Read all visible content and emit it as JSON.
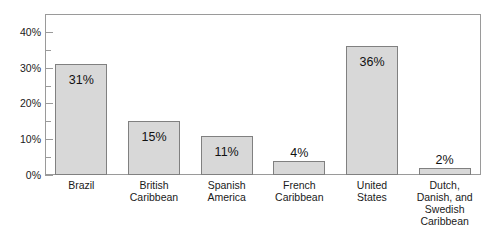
{
  "chart_data": {
    "type": "bar",
    "title": "",
    "subtitle": "",
    "xlabel": "",
    "ylabel": "",
    "categories": [
      "Brazil",
      "British Caribbean",
      "Spanish America",
      "French Caribbean",
      "United States",
      "Dutch, Danish, and Swedish Caribbean"
    ],
    "category_lines": [
      [
        "Brazil"
      ],
      [
        "British",
        "Caribbean"
      ],
      [
        "Spanish",
        "America"
      ],
      [
        "French",
        "Caribbean"
      ],
      [
        "United",
        "States"
      ],
      [
        "Dutch,",
        "Danish, and",
        "Swedish",
        "Caribbean"
      ]
    ],
    "values": [
      31,
      15,
      11,
      4,
      36,
      2
    ],
    "value_labels": [
      "31%",
      "15%",
      "11%",
      "4%",
      "36%",
      "2%"
    ],
    "label_placement": [
      "inside",
      "inside",
      "inside",
      "outside",
      "inside",
      "outside"
    ],
    "ylim": [
      0,
      45
    ],
    "ytick_values": [
      0,
      10,
      20,
      30,
      40
    ],
    "ytick_labels": [
      "0%",
      "10%",
      "20%",
      "30%",
      "40%"
    ],
    "yminor_tick_values": [
      5,
      15,
      25,
      35,
      45
    ],
    "grid": false,
    "legend": null,
    "legend_position": "none",
    "colors": {
      "bar_fill": "#d8d8d8",
      "bar_border": "#808080",
      "frame": "#9a9a9a",
      "text": "#1a1a1a",
      "background": "#ffffff"
    }
  }
}
